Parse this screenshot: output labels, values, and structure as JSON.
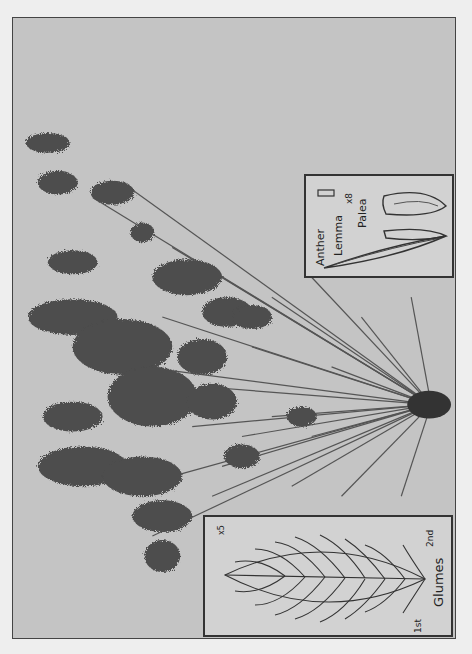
{
  "plate": {
    "subject": "grass specimen (pressed plant with panicles, photographed, rotated 90°)",
    "colors": {
      "background": "#eeeeee",
      "photo": "#c4c4c4",
      "plant": "#4a4a4a",
      "frame": "#444444"
    }
  },
  "insets": {
    "floret": {
      "magnification": "x8",
      "labels": {
        "anther": "Anther",
        "lemma": "Lemma",
        "palea": "Palea"
      }
    },
    "spikelet": {
      "magnification": "x5",
      "labels": {
        "glumes": "Glumes",
        "first": "1st",
        "second": "2nd"
      }
    }
  }
}
